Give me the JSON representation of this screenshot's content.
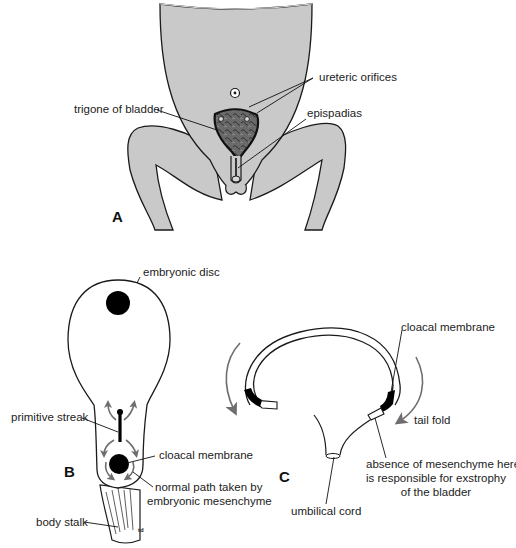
{
  "figure": {
    "panels": [
      {
        "id": "A",
        "label": "A",
        "description": "Frontal view of infant lower abdomen and legs showing exstrophy of the bladder",
        "annotations": {
          "ureteric_orifices": "ureteric orifices",
          "trigone_of_bladder": "trigone of bladder",
          "epispadias": "epispadias"
        }
      },
      {
        "id": "B",
        "label": "B",
        "description": "Dorsal view of embryonic disc",
        "annotations": {
          "embryonic_disc": "embryonic disc",
          "primitive_streak": "primitive streak",
          "cloacal_membrane": "cloacal membrane",
          "mesenchyme_path_line1": "normal path taken by",
          "mesenchyme_path_line2": "embryonic mesenchyme",
          "body_stalk": "body stalk",
          "signature": "td"
        }
      },
      {
        "id": "C",
        "label": "C",
        "description": "Sagittal section of folding embryo",
        "annotations": {
          "cloacal_membrane": "cloacal membrane",
          "tail_fold": "tail fold",
          "absence_line1": "absence of mesenchyme here",
          "absence_line2": "is responsible for exstrophy",
          "absence_line3": "of the bladder",
          "umbilical_cord": "umbilical cord"
        }
      }
    ],
    "colors": {
      "skin_fill": "#c9c9c9",
      "outline": "#1a1a1a",
      "arrow_gray": "#6e6e6e",
      "bladder_fill": "#555555",
      "background": "#ffffff"
    }
  }
}
